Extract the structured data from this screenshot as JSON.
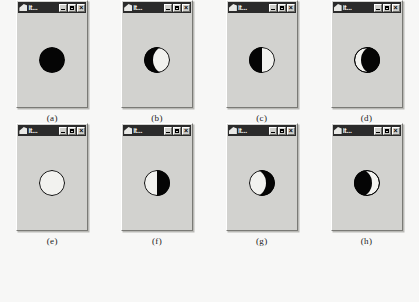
{
  "figure": {
    "caption": "",
    "background_color": "#f7f7f6",
    "panel_color": "#d2d2cf",
    "moon_light_color": "#f2f2ef",
    "moon_dark_color": "#050505"
  },
  "window_chrome": {
    "title": "it...",
    "icon_name": "app-icon",
    "minimize_label": "",
    "maximize_label": "",
    "close_label": "×",
    "titlebar_color": "#2b2b2b",
    "titlebar_text_color": "#f2f2ef"
  },
  "panels": [
    {
      "caption": "(a)",
      "phase": "new-moon",
      "illumination_percent": 0,
      "lit_side": "none"
    },
    {
      "caption": "(b)",
      "phase": "waning-crescent",
      "illumination_percent": 12,
      "lit_side": "right"
    },
    {
      "caption": "(c)",
      "phase": "last-quarter",
      "illumination_percent": 50,
      "lit_side": "right"
    },
    {
      "caption": "(d)",
      "phase": "waxing-gibbous",
      "illumination_percent": 88,
      "lit_side": "right"
    },
    {
      "caption": "(e)",
      "phase": "full-moon",
      "illumination_percent": 100,
      "lit_side": "all"
    },
    {
      "caption": "(f)",
      "phase": "first-quarter",
      "illumination_percent": 50,
      "lit_side": "left"
    },
    {
      "caption": "(g)",
      "phase": "waxing-crescent",
      "illumination_percent": 12,
      "lit_side": "left"
    },
    {
      "caption": "(h)",
      "phase": "waning-gibbous",
      "illumination_percent": 88,
      "lit_side": "left"
    }
  ]
}
